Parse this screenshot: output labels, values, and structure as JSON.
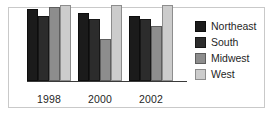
{
  "chart_data": {
    "type": "bar",
    "title": "",
    "xlabel": "",
    "ylabel": "",
    "categories": [
      "1998",
      "2000",
      "2002"
    ],
    "series": [
      {
        "name": "Northeast",
        "color": "#1b1b1b",
        "values": [
          95,
          89,
          86
        ]
      },
      {
        "name": "South",
        "color": "#2c2c2c",
        "values": [
          86,
          82,
          81
        ]
      },
      {
        "name": "Midwest",
        "color": "#8d8d8d",
        "values": [
          97,
          55,
          73
        ]
      },
      {
        "name": "West",
        "color": "#cccccc",
        "values": [
          100,
          100,
          100
        ]
      }
    ],
    "ylim": [
      0,
      100
    ],
    "grid": false,
    "legend_position": "right"
  },
  "legend": {
    "items": [
      {
        "label": "Northeast",
        "swatch": "legend-swatch-northeast"
      },
      {
        "label": "South",
        "swatch": "legend-swatch-south"
      },
      {
        "label": "Midwest",
        "swatch": "legend-swatch-midwest"
      },
      {
        "label": "West",
        "swatch": "legend-swatch-west"
      }
    ]
  },
  "axis": {
    "tick_labels": [
      "1998",
      "2000",
      "2002"
    ]
  }
}
